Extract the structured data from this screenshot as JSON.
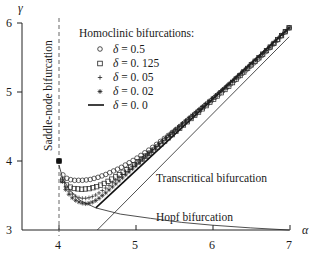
{
  "chart_data": {
    "type": "line",
    "title": "",
    "xlabel": "α",
    "ylabel": "γ",
    "xlim": [
      3.52,
      7.0
    ],
    "ylim": [
      3.0,
      6.0
    ],
    "xticks": [
      4,
      5,
      6,
      7
    ],
    "yticks": [
      3,
      4,
      5,
      6
    ],
    "grid": false,
    "legend": {
      "title": "Homoclinic bifurcations:",
      "position": "upper-left-inside",
      "entries": [
        {
          "marker": "circle",
          "label": "δ = 0.5"
        },
        {
          "marker": "square",
          "label": "δ = 0.125"
        },
        {
          "marker": "plus",
          "label": "δ = 0.05"
        },
        {
          "marker": "star",
          "label": "δ = 0.02"
        },
        {
          "marker": "line",
          "label": "δ = 0.0"
        }
      ]
    },
    "series": [
      {
        "name": "δ = 0.5",
        "marker": "circle",
        "x": [
          4.0,
          4.02,
          4.05,
          4.1,
          4.15,
          4.2,
          4.3,
          4.4,
          4.5,
          4.6,
          4.8,
          5.0,
          5.2,
          5.4,
          5.6,
          5.8,
          6.0,
          6.2,
          6.4,
          6.6,
          6.8,
          7.0
        ],
        "y": [
          4.0,
          3.88,
          3.8,
          3.75,
          3.73,
          3.72,
          3.72,
          3.73,
          3.76,
          3.8,
          3.9,
          4.03,
          4.18,
          4.35,
          4.52,
          4.7,
          4.89,
          5.08,
          5.28,
          5.48,
          5.7,
          5.93
        ]
      },
      {
        "name": "δ = 0.125",
        "marker": "square",
        "x": [
          4.0,
          4.02,
          4.05,
          4.1,
          4.15,
          4.2,
          4.3,
          4.4,
          4.5,
          4.6,
          4.8,
          5.0,
          5.2,
          5.4,
          5.6,
          5.8,
          6.0,
          6.2,
          6.4,
          6.6,
          6.8,
          7.0
        ],
        "y": [
          4.0,
          3.82,
          3.72,
          3.65,
          3.62,
          3.6,
          3.59,
          3.6,
          3.63,
          3.68,
          3.81,
          3.96,
          4.13,
          4.31,
          4.5,
          4.69,
          4.88,
          5.07,
          5.28,
          5.49,
          5.7,
          5.93
        ]
      },
      {
        "name": "δ = 0.05",
        "marker": "plus",
        "x": [
          4.0,
          4.03,
          4.06,
          4.1,
          4.15,
          4.2,
          4.25,
          4.3,
          4.35,
          4.4,
          4.45,
          4.5,
          4.6,
          4.8,
          5.0,
          5.2,
          5.4,
          5.6,
          5.8,
          6.0,
          6.2,
          6.4,
          6.6,
          6.8,
          7.0
        ],
        "y": [
          4.0,
          3.78,
          3.68,
          3.6,
          3.54,
          3.5,
          3.47,
          3.46,
          3.46,
          3.47,
          3.49,
          3.52,
          3.6,
          3.78,
          3.96,
          4.15,
          4.35,
          4.54,
          4.73,
          4.91,
          5.1,
          5.3,
          5.5,
          5.71,
          5.93
        ]
      },
      {
        "name": "δ = 0.02",
        "marker": "star",
        "x": [
          4.0,
          4.03,
          4.06,
          4.1,
          4.15,
          4.2,
          4.25,
          4.3,
          4.35,
          4.4,
          4.45,
          4.5,
          4.6,
          4.8,
          5.0,
          5.2,
          5.4,
          5.6,
          5.8,
          6.0,
          6.2,
          6.4,
          6.6,
          6.8,
          7.0
        ],
        "y": [
          4.0,
          3.75,
          3.64,
          3.56,
          3.49,
          3.44,
          3.41,
          3.39,
          3.38,
          3.39,
          3.41,
          3.44,
          3.53,
          3.73,
          3.93,
          4.13,
          4.33,
          4.53,
          4.72,
          4.91,
          5.1,
          5.3,
          5.5,
          5.71,
          5.93
        ]
      },
      {
        "name": "δ = 0.0",
        "marker": "line",
        "x": [
          4.48,
          7.0
        ],
        "y": [
          3.32,
          5.93
        ]
      },
      {
        "name": "Transcritical bifurcation",
        "marker": "thin-line",
        "x": [
          4.5,
          7.0
        ],
        "y": [
          3.0,
          5.8
        ]
      },
      {
        "name": "Hopf bifurcation",
        "marker": "thin-line",
        "x": [
          4.0,
          4.05,
          4.14,
          4.27,
          4.48,
          4.8,
          5.19,
          5.6,
          6.0,
          6.5,
          7.0
        ],
        "y": [
          3.94,
          3.74,
          3.58,
          3.43,
          3.32,
          3.23,
          3.17,
          3.11,
          3.07,
          3.03,
          3.0
        ]
      },
      {
        "name": "Saddle-node bifurcation",
        "marker": "dashed-vertical",
        "x": [
          4.0,
          4.0
        ],
        "y": [
          2.93,
          6.07
        ]
      }
    ],
    "annotations": [
      {
        "text": "Saddle-node bifurcation",
        "orientation": "vertical"
      },
      {
        "text": "Transcritical bifurcation"
      },
      {
        "text": "Hopf bifurcation"
      }
    ]
  },
  "labels": {
    "ylabel": "γ",
    "xlabel": "α",
    "xticks": [
      "4",
      "5",
      "6",
      "7"
    ],
    "yticks": [
      "3",
      "4",
      "5",
      "6"
    ],
    "saddle_node": "Saddle-node bifurcation",
    "transcritical": "Transcritical bifurcation",
    "hopf": "Hopf bifurcation",
    "legend_title": "Homoclinic bifurcations:",
    "legend_delta_symbol": "δ",
    "legend_values": [
      "= 0.5",
      "= 0. 125",
      "= 0. 05",
      "= 0. 02",
      "= 0. 0"
    ]
  }
}
